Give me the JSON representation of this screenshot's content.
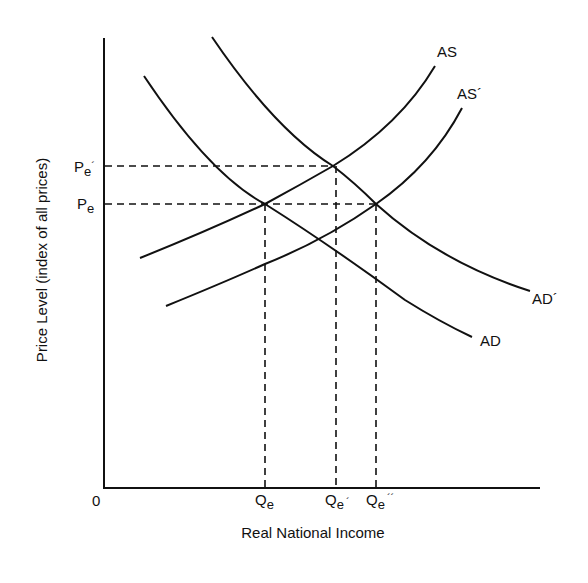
{
  "diagram": {
    "type": "aggregate supply / aggregate demand",
    "x_axis": {
      "label": "Real National Income",
      "origin_label": "0"
    },
    "y_axis": {
      "label": "Price Level (index of all prices)"
    },
    "price_levels": [
      {
        "base": "P",
        "sub": "e",
        "prime": "´",
        "name": "Pe-prime"
      },
      {
        "base": "P",
        "sub": "e",
        "prime": "",
        "name": "Pe"
      }
    ],
    "quantities": [
      {
        "base": "Q",
        "sub": "e",
        "prime": "",
        "name": "Qe"
      },
      {
        "base": "Q",
        "sub": "e",
        "prime": "´",
        "name": "Qe-prime"
      },
      {
        "base": "Q",
        "sub": "e",
        "prime": "´´",
        "name": "Qe-double-prime"
      }
    ],
    "curves": {
      "as": "AS",
      "as_prime": "AS´",
      "ad": "AD",
      "ad_prime": "AD´"
    },
    "equilibria": [
      {
        "curves": [
          "AD",
          "AS"
        ],
        "price": "Pe",
        "quantity": "Qe"
      },
      {
        "curves": [
          "AD´",
          "AS"
        ],
        "price": "Pe´",
        "quantity": "Qe´"
      },
      {
        "curves": [
          "AD´",
          "AS´"
        ],
        "price": "Pe",
        "quantity": "Qe´´"
      }
    ]
  }
}
